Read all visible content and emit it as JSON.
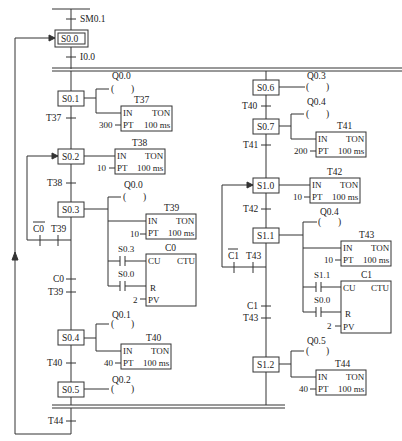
{
  "diagram": {
    "type": "sequential-function-chart",
    "initial": {
      "trigger": "SM0.1",
      "step": "S0.0",
      "transition": "I0.0"
    },
    "left_branch": {
      "steps": [
        {
          "id": "S0.1",
          "coil": "Q0.0",
          "timer": {
            "name": "T37",
            "type": "TON",
            "pt": "300",
            "base": "100 ms"
          }
        },
        {
          "id": "S0.2",
          "timer": {
            "name": "T38",
            "type": "TON",
            "pt": "10",
            "base": "100 ms"
          }
        },
        {
          "id": "S0.3",
          "coil": "Q0.0",
          "timer": {
            "name": "T39",
            "type": "TON",
            "pt": "10",
            "base": "100 ms"
          },
          "counter": {
            "name": "C0",
            "type": "CTU",
            "cu": "S0.3",
            "r": "S0.0",
            "pv": "2"
          }
        },
        {
          "id": "S0.4",
          "coil": "Q0.1",
          "timer": {
            "name": "T40",
            "type": "TON",
            "pt": "40",
            "base": "100 ms"
          }
        },
        {
          "id": "S0.5",
          "coil": "Q0.2"
        }
      ],
      "transitions": [
        "T37",
        "T38",
        "C0",
        "T39",
        "T40"
      ],
      "loop_back": {
        "not_contact": "C0",
        "contact": "T39"
      }
    },
    "right_branch": {
      "steps": [
        {
          "id": "S0.6",
          "coil": "Q0.3"
        },
        {
          "id": "S0.7",
          "coil": "Q0.4",
          "timer": {
            "name": "T41",
            "type": "TON",
            "pt": "200",
            "base": "100 ms"
          }
        },
        {
          "id": "S1.0",
          "timer": {
            "name": "T42",
            "type": "TON",
            "pt": "10",
            "base": "100 ms"
          }
        },
        {
          "id": "S1.1",
          "coil": "Q0.4",
          "timer": {
            "name": "T43",
            "type": "TON",
            "pt": "10",
            "base": "100 ms"
          },
          "counter": {
            "name": "C1",
            "type": "CTU",
            "cu": "S1.1",
            "r": "S0.0",
            "pv": "2"
          }
        },
        {
          "id": "S1.2",
          "coil": "Q0.5",
          "timer": {
            "name": "T44",
            "type": "TON",
            "pt": "40",
            "base": "100 ms"
          }
        }
      ],
      "transitions": [
        "T40",
        "T41",
        "T42",
        "C1",
        "T43"
      ],
      "loop_back": {
        "not_contact": "C1",
        "contact": "T43"
      }
    },
    "final_transition": "T44",
    "pin_labels": {
      "in": "IN",
      "pt": "PT",
      "cu": "CU",
      "r": "R",
      "pv": "PV"
    }
  }
}
